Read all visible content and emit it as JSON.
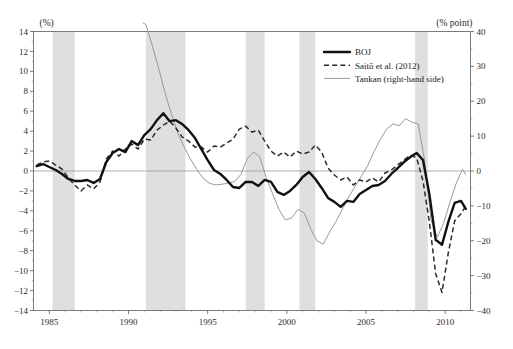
{
  "chart_data": {
    "type": "line",
    "title": "",
    "xlabel": "",
    "ylabel": "(%)",
    "y2label": "(% point)",
    "xlim": [
      1984.0,
      2011.6
    ],
    "ylim": [
      -14,
      14
    ],
    "y2lim": [
      -40,
      40
    ],
    "grid": false,
    "legend_position": "upper-right-inside",
    "x_ticks": [
      "1985",
      "1990",
      "1995",
      "2000",
      "2005",
      "2010"
    ],
    "x_tick_values": [
      1985,
      1990,
      1995,
      2000,
      2005,
      2010
    ],
    "y_ticks": [
      "14",
      "12",
      "10",
      "8",
      "6",
      "4",
      "2",
      "0",
      "−2",
      "−4",
      "−6",
      "−8",
      "−10",
      "−12",
      "−14"
    ],
    "y_tick_values": [
      14,
      12,
      10,
      8,
      6,
      4,
      2,
      0,
      -2,
      -4,
      -6,
      -8,
      -10,
      -12,
      -14
    ],
    "y2_ticks": [
      "40",
      "30",
      "20",
      "10",
      "0",
      "−10",
      "−20",
      "−30",
      "−40"
    ],
    "y2_tick_values": [
      40,
      30,
      20,
      10,
      0,
      -10,
      -20,
      -30,
      -40
    ],
    "shaded_bands_label": "recession periods",
    "shaded_bands": [
      [
        1985.2,
        1986.6
      ],
      [
        1991.1,
        1993.6
      ],
      [
        1997.4,
        1998.6
      ],
      [
        2000.8,
        2001.8
      ],
      [
        2008.1,
        2008.9
      ]
    ],
    "series": [
      {
        "name": "BOJ",
        "style": "solid-thick",
        "axis": "left",
        "color": "#111111",
        "x": [
          1984.2,
          1984.6,
          1985.0,
          1985.4,
          1985.8,
          1986.2,
          1986.6,
          1987.0,
          1987.4,
          1987.8,
          1988.2,
          1988.6,
          1989.0,
          1989.4,
          1989.8,
          1990.2,
          1990.6,
          1991.0,
          1991.4,
          1991.8,
          1992.2,
          1992.6,
          1993.0,
          1993.4,
          1993.8,
          1994.2,
          1994.6,
          1995.0,
          1995.4,
          1995.8,
          1996.2,
          1996.6,
          1997.0,
          1997.4,
          1997.8,
          1998.2,
          1998.6,
          1999.0,
          1999.4,
          1999.8,
          2000.2,
          2000.6,
          2001.0,
          2001.4,
          2001.8,
          2002.2,
          2002.6,
          2003.0,
          2003.4,
          2003.8,
          2004.2,
          2004.6,
          2005.0,
          2005.4,
          2005.8,
          2006.2,
          2006.6,
          2007.0,
          2007.4,
          2007.8,
          2008.2,
          2008.6,
          2009.0,
          2009.4,
          2009.8,
          2010.2,
          2010.6,
          2011.0,
          2011.3
        ],
        "y": [
          0.5,
          0.7,
          0.4,
          0.1,
          -0.3,
          -0.8,
          -1.0,
          -1.0,
          -0.9,
          -1.2,
          -0.8,
          0.9,
          1.8,
          2.2,
          1.9,
          3.0,
          2.6,
          3.6,
          4.2,
          5.1,
          5.8,
          5.0,
          5.1,
          4.7,
          4.1,
          3.3,
          2.2,
          1.1,
          0.1,
          -0.3,
          -0.9,
          -1.6,
          -1.7,
          -1.1,
          -1.1,
          -1.5,
          -0.9,
          -1.1,
          -2.1,
          -2.4,
          -2.0,
          -1.4,
          -0.6,
          -0.1,
          -0.8,
          -1.7,
          -2.7,
          -3.1,
          -3.6,
          -3.0,
          -3.1,
          -2.3,
          -1.9,
          -1.5,
          -1.4,
          -1.0,
          -0.3,
          0.3,
          0.9,
          1.4,
          1.8,
          1.1,
          -2.3,
          -6.9,
          -7.4,
          -5.1,
          -3.2,
          -3.0,
          -3.8
        ]
      },
      {
        "name": "Saitō et al. (2012)",
        "style": "dashed",
        "axis": "left",
        "color": "#2a2a2a",
        "x": [
          1984.2,
          1984.6,
          1985.0,
          1985.4,
          1985.8,
          1986.2,
          1986.6,
          1987.0,
          1987.4,
          1987.8,
          1988.2,
          1988.6,
          1989.0,
          1989.4,
          1989.8,
          1990.2,
          1990.6,
          1991.0,
          1991.4,
          1991.8,
          1992.2,
          1992.6,
          1993.0,
          1993.4,
          1993.8,
          1994.2,
          1994.6,
          1995.0,
          1995.4,
          1995.8,
          1996.2,
          1996.6,
          1997.0,
          1997.4,
          1997.8,
          1998.2,
          1998.6,
          1999.0,
          1999.4,
          1999.8,
          2000.2,
          2000.6,
          2001.0,
          2001.4,
          2001.8,
          2002.2,
          2002.6,
          2003.0,
          2003.4,
          2003.8,
          2004.2,
          2004.6,
          2005.0,
          2005.4,
          2005.8,
          2006.2,
          2006.6,
          2007.0,
          2007.4,
          2007.8,
          2008.2,
          2008.6,
          2009.0,
          2009.4,
          2009.8,
          2010.2,
          2010.6,
          2011.0,
          2011.3
        ],
        "y": [
          0.6,
          0.9,
          1.0,
          0.6,
          0.2,
          -0.7,
          -1.4,
          -2.0,
          -1.4,
          -1.8,
          -1.1,
          1.2,
          2.0,
          1.5,
          2.2,
          2.7,
          2.2,
          3.2,
          3.1,
          4.1,
          4.6,
          5.0,
          4.3,
          3.4,
          3.0,
          2.4,
          2.4,
          1.9,
          2.5,
          2.4,
          2.8,
          3.2,
          4.2,
          4.5,
          3.9,
          4.1,
          3.0,
          2.0,
          1.5,
          1.9,
          1.4,
          2.0,
          1.7,
          1.9,
          2.6,
          1.9,
          0.3,
          -0.4,
          -0.9,
          -0.6,
          -1.4,
          -0.9,
          -1.1,
          -0.7,
          -1.1,
          -0.2,
          0.1,
          0.6,
          1.1,
          1.6,
          1.3,
          -1.0,
          -5.1,
          -10.3,
          -12.2,
          -8.2,
          -5.0,
          -4.3,
          -3.5
        ]
      },
      {
        "name": "Tankan (right-hand side)",
        "style": "solid-thin",
        "axis": "right",
        "color": "#9a9a9a",
        "x": [
          1990.9,
          1991.1,
          1991.5,
          1991.9,
          1992.3,
          1992.7,
          1993.1,
          1993.5,
          1993.9,
          1994.3,
          1994.7,
          1995.1,
          1995.5,
          1995.9,
          1996.3,
          1996.7,
          1997.1,
          1997.5,
          1997.9,
          1998.3,
          1998.7,
          1999.1,
          1999.5,
          1999.9,
          2000.3,
          2000.7,
          2001.1,
          2001.5,
          2001.9,
          2002.3,
          2002.7,
          2003.1,
          2003.5,
          2003.9,
          2004.3,
          2004.7,
          2005.1,
          2005.5,
          2005.9,
          2006.3,
          2006.7,
          2007.1,
          2007.5,
          2007.9,
          2008.3,
          2008.7,
          2009.1,
          2009.5,
          2009.9,
          2010.3,
          2010.7,
          2011.1,
          2011.3
        ],
        "y": [
          42.5,
          42.0,
          36.0,
          29.5,
          22.5,
          16.5,
          11.0,
          7.0,
          3.5,
          0.5,
          -2.0,
          -3.5,
          -4.0,
          -3.8,
          -3.5,
          -3.0,
          -1.0,
          3.5,
          5.5,
          4.0,
          -2.0,
          -6.5,
          -11.0,
          -14.0,
          -13.5,
          -11.0,
          -12.0,
          -16.5,
          -20.0,
          -21.0,
          -17.5,
          -14.5,
          -11.0,
          -7.5,
          -4.5,
          -1.5,
          1.5,
          5.5,
          9.0,
          12.0,
          13.5,
          13.0,
          15.0,
          14.0,
          13.5,
          3.0,
          -14.0,
          -19.0,
          -15.0,
          -9.0,
          -3.5,
          0.5,
          -1.0
        ]
      }
    ]
  },
  "legend": {
    "items": [
      {
        "label": "BOJ",
        "style": "solid-thick"
      },
      {
        "label": "Saitō et al. (2012)",
        "style": "dashed"
      },
      {
        "label": "Tankan (right-hand side)",
        "style": "solid-thin"
      }
    ]
  },
  "caption_fragment": ""
}
